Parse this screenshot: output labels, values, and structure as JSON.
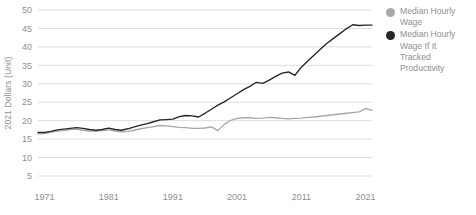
{
  "chart_data": {
    "type": "line",
    "title": "",
    "xlabel": "",
    "ylabel": "2021 Dollars (Unit)",
    "ylim": [
      5,
      50
    ],
    "ytick_step": 5,
    "yticks": [
      50,
      45,
      40,
      35,
      30,
      25,
      20,
      15,
      10,
      5
    ],
    "xlim": [
      1970,
      2022
    ],
    "xticks": [
      1971,
      1981,
      1991,
      2001,
      2011,
      2021
    ],
    "xtick_labels": [
      "1971",
      "1981",
      "1991",
      "2001",
      "2011",
      "2021"
    ],
    "grid": "horizontal",
    "legend_position": "right",
    "x": [
      1970,
      1971,
      1972,
      1973,
      1974,
      1975,
      1976,
      1977,
      1978,
      1979,
      1980,
      1981,
      1982,
      1983,
      1984,
      1985,
      1986,
      1987,
      1988,
      1989,
      1990,
      1991,
      1992,
      1993,
      1994,
      1995,
      1996,
      1997,
      1998,
      1999,
      2000,
      2001,
      2002,
      2003,
      2004,
      2005,
      2006,
      2007,
      2008,
      2009,
      2010,
      2011,
      2012,
      2013,
      2014,
      2015,
      2016,
      2017,
      2018,
      2019,
      2020,
      2021,
      2022
    ],
    "series": [
      {
        "name": "Median Hourly Wage",
        "color": "#a8a8a8",
        "values": [
          16.4,
          16.5,
          16.9,
          17.2,
          17.3,
          17.6,
          17.7,
          17.4,
          17.2,
          17.1,
          17.3,
          17.5,
          17.2,
          17.0,
          17.1,
          17.4,
          17.8,
          18.1,
          18.4,
          18.7,
          18.6,
          18.4,
          18.2,
          18.1,
          17.9,
          17.9,
          18.0,
          18.3,
          17.3,
          19.0,
          20.1,
          20.6,
          20.8,
          20.8,
          20.6,
          20.7,
          20.9,
          20.8,
          20.6,
          20.5,
          20.6,
          20.7,
          20.9,
          21.0,
          21.2,
          21.4,
          21.6,
          21.8,
          22.0,
          22.2,
          22.4,
          23.3,
          22.8
        ]
      },
      {
        "name": "Median Hourly Wage If It Tracked Productivity",
        "color": "#262626",
        "values": [
          16.8,
          16.8,
          17.1,
          17.5,
          17.7,
          17.9,
          18.1,
          17.9,
          17.6,
          17.4,
          17.6,
          18.0,
          17.6,
          17.4,
          17.8,
          18.3,
          18.8,
          19.2,
          19.7,
          20.2,
          20.3,
          20.4,
          21.1,
          21.4,
          21.3,
          21.0,
          22.0,
          23.1,
          24.2,
          25.1,
          26.2,
          27.3,
          28.4,
          29.3,
          30.4,
          30.1,
          31.0,
          32.0,
          32.9,
          33.2,
          32.3,
          34.5,
          36.2,
          37.8,
          39.4,
          41.0,
          42.3,
          43.6,
          44.9,
          46.0,
          45.8,
          45.9,
          45.9
        ]
      }
    ]
  },
  "legend": {
    "items": [
      {
        "label": "Median Hourly Wage",
        "color": "#a8a8a8",
        "marker": "circle-marker"
      },
      {
        "label": "Median Hourly Wage If It Tracked Productivity",
        "color": "#262626",
        "marker": "circle-marker"
      }
    ]
  }
}
